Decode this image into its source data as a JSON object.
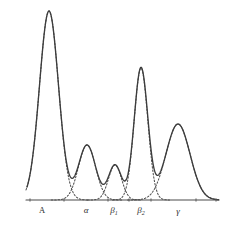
{
  "figure": {
    "background_color": "#ffffff",
    "line_color": "#3d3d3d",
    "dotted_color": "#4f4f4f",
    "axis_color": "#4a4a4a",
    "width": 229,
    "height": 229
  },
  "axis": {
    "baseline_y": 200,
    "x_start": 26,
    "x_end": 219,
    "has_ticks": true,
    "tick_positions": [
      30,
      64,
      108,
      129,
      151,
      196,
      216
    ]
  },
  "labels": [
    {
      "text": "A",
      "sub": "",
      "x": 42,
      "y": 213,
      "style": "roman"
    },
    {
      "text": "α",
      "sub": "",
      "x": 86,
      "y": 213,
      "style": "italic"
    },
    {
      "text": "β",
      "sub": "1",
      "x": 114,
      "y": 213,
      "style": "italic"
    },
    {
      "text": "β",
      "sub": "2",
      "x": 141,
      "y": 213,
      "style": "italic"
    },
    {
      "text": "γ",
      "sub": "",
      "x": 178,
      "y": 214,
      "style": "italic"
    }
  ],
  "chart_data": {
    "type": "line",
    "xlabel": "",
    "ylabel": "",
    "grid": false,
    "legend": "none",
    "xlim": [
      26,
      219
    ],
    "ylim": [
      0,
      200
    ],
    "baseline": 200,
    "categories": [
      "A",
      "α",
      "β₁",
      "β₂",
      "γ"
    ],
    "components": [
      {
        "name": "A",
        "label": "A",
        "style": "dotted",
        "center": 49,
        "peak_y": 11,
        "amplitude": 189,
        "sigma": 9.5,
        "relative_height": 1.0
      },
      {
        "name": "alpha",
        "label": "α",
        "style": "dotted",
        "center": 87,
        "peak_y": 145,
        "amplitude": 55,
        "sigma": 8.5,
        "relative_height": 0.29
      },
      {
        "name": "beta1",
        "label": "β₁",
        "style": "dotted",
        "center": 115,
        "peak_y": 165,
        "amplitude": 35,
        "sigma": 6.5,
        "relative_height": 0.185
      },
      {
        "name": "beta2",
        "label": "β₂",
        "style": "dotted",
        "center": 141,
        "peak_y": 68,
        "amplitude": 132,
        "sigma": 6.8,
        "relative_height": 0.7
      },
      {
        "name": "gamma",
        "label": "γ",
        "style": "dotted",
        "center": 178,
        "peak_y": 124,
        "amplitude": 76,
        "sigma": 12.0,
        "relative_height": 0.4
      }
    ],
    "envelope": {
      "name": "total",
      "style": "solid",
      "description": "Sum of the five Gaussian fractions",
      "peaks": [
        {
          "label": "A",
          "x": 49,
          "y": 11,
          "height": 189
        },
        {
          "label": "α",
          "x": 87,
          "y": 143,
          "height": 57
        },
        {
          "label": "β₁",
          "x": 115,
          "y": 163,
          "height": 37
        },
        {
          "label": "β₂",
          "x": 141,
          "y": 68,
          "height": 132
        },
        {
          "label": "γ",
          "x": 178,
          "y": 122,
          "height": 78
        }
      ],
      "valleys": [
        {
          "x": 70,
          "y": 176
        },
        {
          "x": 102,
          "y": 170
        },
        {
          "x": 128,
          "y": 174
        },
        {
          "x": 159,
          "y": 136
        }
      ]
    }
  }
}
